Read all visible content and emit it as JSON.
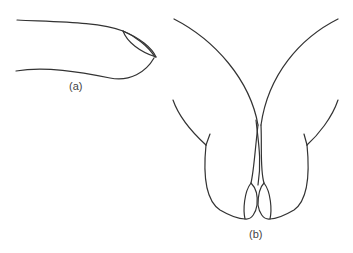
{
  "figure": {
    "panels": [
      {
        "id": "a",
        "label": "(a)",
        "description": "side view of fingertip with nail"
      },
      {
        "id": "b",
        "label": "(b)",
        "description": "two fingertips pressed together, front view showing nails"
      }
    ],
    "colors": {
      "line": "#333333",
      "background": "#ffffff",
      "label": "#444444"
    }
  }
}
